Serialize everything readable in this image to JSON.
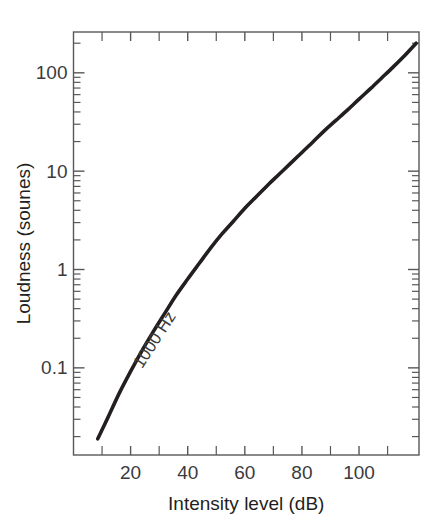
{
  "chart_data": {
    "type": "line",
    "title": "",
    "xlabel": "Intensity level (dB)",
    "ylabel": "Loudness (sounes)",
    "xlim": [
      0,
      121
    ],
    "ylim": [
      0.013,
      260
    ],
    "yscale": "log",
    "xscale": "linear",
    "grid": false,
    "legend": null,
    "x_major_ticks": [
      20,
      40,
      60,
      80,
      100
    ],
    "x_major_tick_labels": [
      "20",
      "40",
      "60",
      "80",
      "100"
    ],
    "x_minor_ticks": [
      10,
      30,
      50,
      70,
      90,
      110
    ],
    "y_major_ticks": [
      0.1,
      1,
      10,
      100
    ],
    "y_major_tick_labels": [
      "0.1",
      "1",
      "10",
      "100"
    ],
    "annotations": [
      {
        "text": "1000 Hz",
        "x_db": 30,
        "y_sones": 0.18,
        "rotation_deg": -57
      }
    ],
    "series": [
      {
        "name": "1000 Hz",
        "color": "#231f20",
        "x": [
          8.5,
          12,
          16,
          20,
          24,
          28,
          32,
          36,
          40,
          44,
          48,
          52,
          56,
          60,
          64,
          68,
          72,
          76,
          80,
          84,
          88,
          92,
          96,
          100,
          104,
          108,
          112,
          116,
          120
        ],
        "y": [
          0.019,
          0.031,
          0.055,
          0.092,
          0.15,
          0.235,
          0.36,
          0.55,
          0.8,
          1.15,
          1.65,
          2.3,
          3.1,
          4.2,
          5.5,
          7.2,
          9.3,
          12.0,
          15.5,
          20.0,
          26.0,
          33.0,
          42.0,
          54.0,
          69.0,
          89.0,
          115.0,
          150.0,
          200.0
        ]
      }
    ]
  }
}
